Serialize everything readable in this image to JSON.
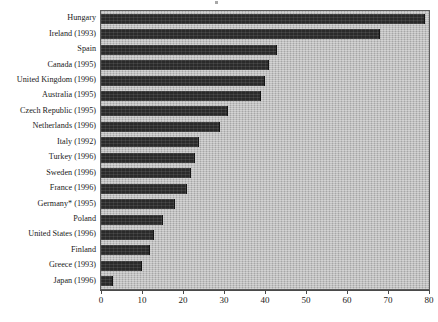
{
  "chart_data": {
    "type": "bar",
    "orientation": "horizontal",
    "title": "",
    "subtitle": "",
    "xlabel": "",
    "ylabel": "",
    "xlim": [
      0,
      80
    ],
    "grid": false,
    "legend": null,
    "footnote_marker": "*",
    "axis": {
      "ticks": [
        0,
        10,
        20,
        30,
        40,
        50,
        60,
        70,
        80
      ],
      "tick_labels": [
        "0",
        "10",
        "20",
        "30",
        "40",
        "50",
        "60",
        "70",
        "80"
      ]
    },
    "categories": [
      "Hungary",
      "Ireland (1993)",
      "Spain",
      "Canada (1995)",
      "United Kingdom  (1996)",
      "Australia (1995)",
      "Czech Republic (1995)",
      "Netherlands (1996)",
      "Italy (1992)",
      "Turkey (1996)",
      "Sweden (1996)",
      "France (1996)",
      "Germany* (1995)",
      "Poland",
      "United States (1996)",
      "Finland",
      "Greece (1993)",
      "Japan (1996)"
    ],
    "values": [
      79,
      68,
      43,
      41,
      40,
      39,
      31,
      29,
      24,
      23,
      22,
      21,
      18,
      15,
      13,
      12,
      10,
      3
    ],
    "series": [
      {
        "name": "value",
        "values": [
          79,
          68,
          43,
          41,
          40,
          39,
          31,
          29,
          24,
          23,
          22,
          21,
          18,
          15,
          13,
          12,
          10,
          3
        ]
      }
    ],
    "colors": {
      "bar": "#2a2a2a",
      "plot_background": "#b9b9b9",
      "axis": "#4a4a4a",
      "text": "#1a1a1a"
    }
  }
}
